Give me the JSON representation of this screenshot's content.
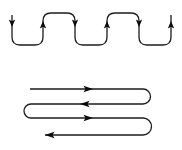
{
  "background": "#ffffff",
  "colors": {
    "line": "#1c1c1c",
    "arrowhead": "#0a0a0a"
  },
  "diagrams": {
    "top_serpentine": {
      "kind": "vertical-square-wave-path",
      "arrow_directions": [
        "down",
        "up",
        "down",
        "up",
        "down",
        "up"
      ],
      "arrow_count": 6
    },
    "bottom_boustrophedon": {
      "kind": "horizontal-serpentine-scan-path",
      "arrow_directions": [
        "right",
        "left",
        "right",
        "left"
      ],
      "arrow_count": 4,
      "row_count": 4
    }
  }
}
